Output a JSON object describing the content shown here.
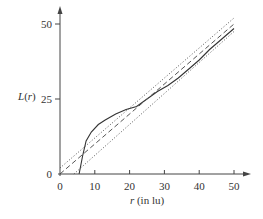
{
  "chart_data": {
    "type": "line",
    "title": "",
    "xlabel": "r (in lu)",
    "ylabel": "L(r)",
    "xlim": [
      0,
      53
    ],
    "ylim": [
      0,
      55
    ],
    "x_ticks": [
      0,
      10,
      20,
      30,
      40,
      50
    ],
    "y_ticks": [
      0,
      25,
      50
    ],
    "x_tick_labels": [
      "0",
      "10",
      "20",
      "30",
      "40",
      "50"
    ],
    "y_tick_labels": [
      "0",
      "25",
      "50"
    ],
    "grid": false,
    "legend": null,
    "series": [
      {
        "name": "observed L(r)",
        "style": "solid",
        "x": [
          5.5,
          6.5,
          7.5,
          9,
          11,
          13,
          16,
          19,
          22,
          25,
          28,
          31,
          34,
          37,
          40,
          43,
          46,
          50
        ],
        "y": [
          0,
          6,
          11,
          14,
          16.5,
          18,
          20,
          21.5,
          22.5,
          25,
          27.5,
          29.5,
          32,
          35,
          38,
          41.5,
          44.5,
          48.5
        ]
      },
      {
        "name": "theoretical L(r)=r",
        "style": "dashed",
        "x": [
          0,
          50
        ],
        "y": [
          0,
          50
        ]
      },
      {
        "name": "upper envelope",
        "style": "dotted",
        "x": [
          0,
          50
        ],
        "y": [
          2,
          52
        ]
      },
      {
        "name": "lower envelope",
        "style": "dotted",
        "x": [
          4,
          50
        ],
        "y": [
          0,
          47.5
        ]
      }
    ]
  }
}
